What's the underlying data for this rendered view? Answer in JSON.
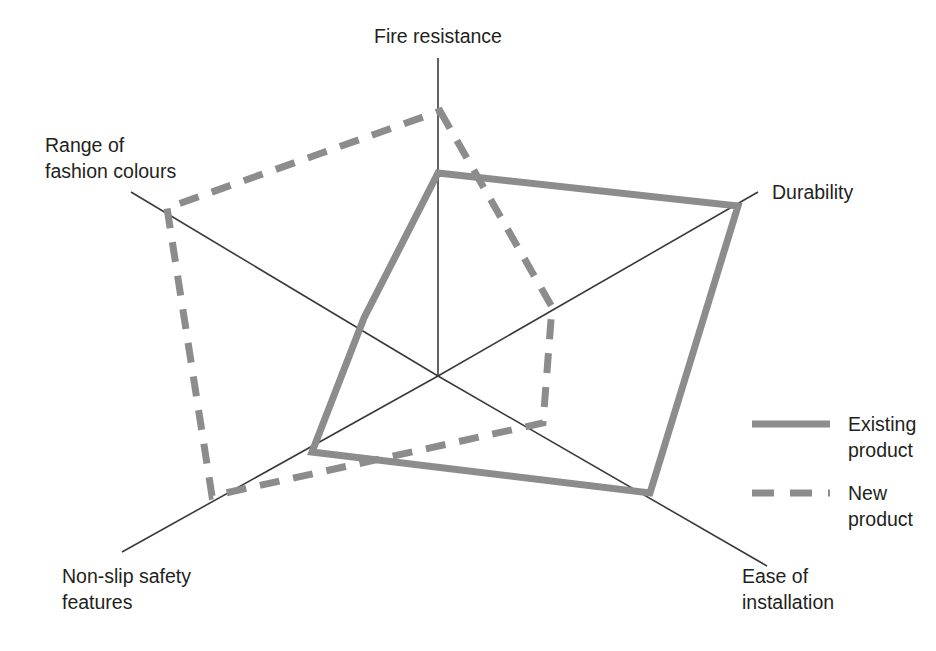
{
  "chart_data": {
    "type": "radar",
    "title": "",
    "subtitle": "",
    "xlabel": "",
    "ylabel": "",
    "grid": false,
    "legend_position": "right",
    "scale_min": 0,
    "scale_max": 10,
    "categories": [
      "Fire resistance",
      "Durability",
      "Ease of installation",
      "Non-slip safety features",
      "Range of fashion colours"
    ],
    "series": [
      {
        "name": "Existing product",
        "style": "solid",
        "color": "#8c8c8c",
        "values": [
          6.4,
          9.2,
          6.5,
          4.1,
          2.3
        ]
      },
      {
        "name": "New product",
        "style": "dashed",
        "color": "#8c8c8c",
        "values": [
          8.3,
          3.7,
          3.5,
          7.9,
          8.9
        ]
      }
    ]
  },
  "geometry": {
    "center": {
      "x": 438,
      "y": 376
    },
    "axes": [
      {
        "key": "fire_resistance",
        "angle_deg": -90,
        "end": {
          "x": 438,
          "y": 58
        },
        "radius": 318
      },
      {
        "key": "durability",
        "angle_deg": -34,
        "end": {
          "x": 758,
          "y": 192
        },
        "radius": 347
      },
      {
        "key": "ease_of_installation",
        "angle_deg": 35,
        "end": {
          "x": 767,
          "y": 566
        },
        "radius": 392
      },
      {
        "key": "non_slip_safety_features",
        "angle_deg": 152,
        "end": {
          "x": 122,
          "y": 552
        },
        "radius": 347
      },
      {
        "key": "range_of_fashion_colours",
        "angle_deg": 210,
        "end": {
          "x": 131,
          "y": 192
        },
        "radius": 349
      }
    ],
    "series_points": {
      "existing_product": [
        {
          "x": 438,
          "y": 173
        },
        {
          "x": 738,
          "y": 206
        },
        {
          "x": 650,
          "y": 493
        },
        {
          "x": 312,
          "y": 452
        },
        {
          "x": 364,
          "y": 318
        }
      ],
      "new_product": [
        {
          "x": 440,
          "y": 111
        },
        {
          "x": 552,
          "y": 307
        },
        {
          "x": 543,
          "y": 423
        },
        {
          "x": 212,
          "y": 496
        },
        {
          "x": 167,
          "y": 208
        }
      ]
    },
    "labels": [
      {
        "key": "fire_resistance",
        "lines": [
          "Fire resistance"
        ],
        "x": 438,
        "y": 43,
        "anchor": "middle"
      },
      {
        "key": "durability",
        "lines": [
          "Durability"
        ],
        "x": 772,
        "y": 199,
        "anchor": "start"
      },
      {
        "key": "ease_of_installation",
        "lines": [
          "Ease of",
          "installation"
        ],
        "x": 742,
        "y": 583,
        "anchor": "start"
      },
      {
        "key": "non_slip_safety_features",
        "lines": [
          "Non-slip safety",
          "features"
        ],
        "x": 62,
        "y": 583,
        "anchor": "start"
      },
      {
        "key": "range_of_fashion_colours",
        "lines": [
          "Range of",
          "fashion colours"
        ],
        "x": 45,
        "y": 152,
        "anchor": "start"
      }
    ],
    "legend": {
      "items": [
        {
          "key": "existing_product",
          "lines": [
            "Existing",
            "product"
          ],
          "swatch": {
            "x1": 752,
            "y1": 424,
            "x2": 830,
            "y2": 424
          },
          "text_x": 848,
          "text_y": 431
        },
        {
          "key": "new_product",
          "lines": [
            "New",
            "product"
          ],
          "swatch": {
            "x1": 752,
            "y1": 493,
            "x2": 830,
            "y2": 493
          },
          "text_x": 848,
          "text_y": 500
        }
      ]
    }
  },
  "legend": {
    "existing_label_line1": "Existing",
    "existing_label_line2": "product",
    "new_label_line1": "New",
    "new_label_line2": "product"
  },
  "labels": {
    "fire_resistance": "Fire resistance",
    "durability": "Durability",
    "ease_line1": "Ease of",
    "ease_line2": "installation",
    "nonslip_line1": "Non-slip safety",
    "nonslip_line2": "features",
    "colours_line1": "Range of",
    "colours_line2": "fashion colours"
  },
  "colors": {
    "series_gray": "#8c8c8c",
    "axis_gray": "#3a3a3a",
    "text": "#231f20",
    "background": "#ffffff"
  }
}
